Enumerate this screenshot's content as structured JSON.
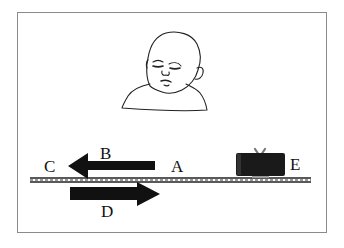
{
  "diagram": {
    "type": "physics-scene",
    "labels": {
      "A": "A",
      "B": "B",
      "C": "C",
      "D": "D",
      "E": "E"
    },
    "elements": {
      "arrow_upper": {
        "direction": "left",
        "from_label": "A",
        "to_label": "C",
        "name_label": "B"
      },
      "arrow_lower": {
        "direction": "right",
        "name_label": "D"
      },
      "train": {
        "label": "E",
        "color": "#1a1a1a"
      },
      "track": {
        "color": "#222222"
      }
    },
    "colors": {
      "frame_border": "#8a8a8a",
      "ink": "#111111",
      "background": "#ffffff"
    }
  }
}
